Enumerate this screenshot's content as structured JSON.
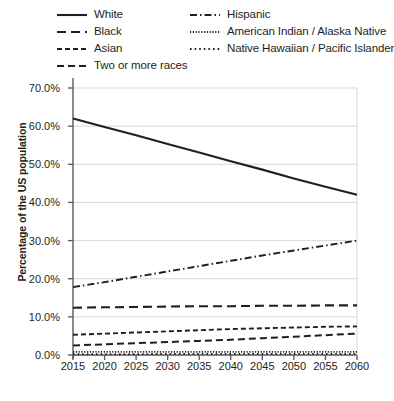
{
  "legend": {
    "columns": [
      {
        "items": [
          {
            "label": "White",
            "style": "solid"
          },
          {
            "label": "Black",
            "style": "long-dash"
          },
          {
            "label": "Asian",
            "style": "dash"
          },
          {
            "label": "Two or more races",
            "style": "medium-dash"
          }
        ]
      },
      {
        "items": [
          {
            "label": "Hispanic",
            "style": "dash-dot"
          },
          {
            "label": "American Indian / Alaska Native",
            "style": "fine-dot"
          },
          {
            "label": "Native Hawaiian / Pacific Islander",
            "style": "dot"
          }
        ]
      }
    ]
  },
  "axes": {
    "ylabel": "Percentage of the US population",
    "yticks": [
      "0.0%",
      "10.0%",
      "20.0%",
      "30.0%",
      "40.0%",
      "50.0%",
      "60.0%",
      "70.0%"
    ],
    "xticks": [
      "2015",
      "2020",
      "2025",
      "2030",
      "2035",
      "2040",
      "2045",
      "2050",
      "2055",
      "2060"
    ]
  },
  "colors": {
    "line": "#231f20",
    "grid": "#d9d9d9",
    "axis": "#58595b",
    "background": "#ffffff"
  },
  "chart_data": {
    "type": "line",
    "title": "",
    "xlabel": "",
    "ylabel": "Percentage of the US population",
    "x": [
      2015,
      2020,
      2025,
      2030,
      2035,
      2040,
      2045,
      2050,
      2055,
      2060
    ],
    "xlim": [
      2015,
      2060
    ],
    "ylim": [
      0,
      70
    ],
    "ytick_values": [
      0,
      10,
      20,
      30,
      40,
      50,
      60,
      70
    ],
    "grid": true,
    "legend_position": "top",
    "series": [
      {
        "name": "White",
        "style": "solid",
        "values": [
          62.0,
          59.8,
          57.6,
          55.3,
          53.1,
          50.8,
          48.6,
          46.3,
          44.1,
          42.0
        ]
      },
      {
        "name": "Black",
        "style": "long-dash",
        "values": [
          12.4,
          12.5,
          12.6,
          12.7,
          12.8,
          12.8,
          12.9,
          12.9,
          13.0,
          13.0
        ]
      },
      {
        "name": "Asian",
        "style": "dash",
        "values": [
          5.3,
          5.6,
          5.9,
          6.2,
          6.5,
          6.8,
          7.0,
          7.2,
          7.4,
          7.5
        ]
      },
      {
        "name": "Two or more races",
        "style": "medium-dash",
        "values": [
          2.5,
          2.8,
          3.1,
          3.4,
          3.7,
          4.0,
          4.4,
          4.8,
          5.2,
          5.6
        ]
      },
      {
        "name": "Hispanic",
        "style": "dash-dot",
        "values": [
          17.8,
          19.1,
          20.5,
          21.9,
          23.3,
          24.7,
          26.1,
          27.4,
          28.7,
          30.0
        ]
      },
      {
        "name": "American Indian / Alaska Native",
        "style": "fine-dot",
        "values": [
          0.8,
          0.8,
          0.8,
          0.8,
          0.8,
          0.8,
          0.8,
          0.8,
          0.8,
          0.8
        ]
      },
      {
        "name": "Native Hawaiian / Pacific Islander",
        "style": "dot",
        "values": [
          0.2,
          0.2,
          0.2,
          0.3,
          0.3,
          0.3,
          0.3,
          0.3,
          0.3,
          0.3
        ]
      }
    ]
  }
}
